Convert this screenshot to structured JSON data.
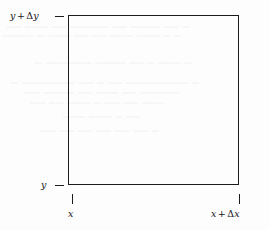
{
  "figure": {
    "kind": "math-diagram",
    "background_color": "#fdfdfd",
    "line_color": "#1b1b1b",
    "text_color": "#151515"
  },
  "rectangle": {
    "name": "region-rectangle",
    "left_px": 68,
    "top_px": 15,
    "width_px": 171,
    "height_px": 170,
    "stroke_width_px": 1.4
  },
  "axis_labels": {
    "y_top": {
      "var": "y",
      "op": "+",
      "delta": "Δ",
      "delta_var": "y",
      "full": "y + Δy"
    },
    "y_bottom": {
      "var": "y",
      "full": "y"
    },
    "x_left": {
      "var": "x",
      "full": "x"
    },
    "x_right": {
      "var": "x",
      "op": "+",
      "delta": "Δ",
      "delta_var": "x",
      "full": "x + Δx"
    }
  },
  "ticks": {
    "top_left": "horizontal-dash",
    "bottom_left": "horizontal-dash",
    "bottom_x": "vertical-dash",
    "bottom_x_plus_dx": "vertical-dash"
  },
  "ghost_text": {
    "note": "faint illegible show-through from reverse page of scan",
    "lines": [
      {
        "top": 22,
        "left": 6,
        "text": "— —— ———— —— ————— —— ——— ——"
      },
      {
        "top": 31,
        "left": 2,
        "text": "— — ——— ——— —— —— ——— — ————"
      },
      {
        "top": 58,
        "left": 34,
        "text": "— ——— — —— ———— —————— —"
      },
      {
        "top": 78,
        "left": 10,
        "text": "— ———————— —— — —— ——————— —"
      },
      {
        "top": 88,
        "left": 24,
        "text": "————— —— ——— —— ———— ——"
      },
      {
        "top": 98,
        "left": 30,
        "text": "——— —— —— — ——— —— ——"
      },
      {
        "top": 112,
        "left": 62,
        "text": "—— — ——— ———"
      },
      {
        "top": 126,
        "left": 40,
        "text": "— —— —— —— —— —— ——"
      }
    ]
  }
}
